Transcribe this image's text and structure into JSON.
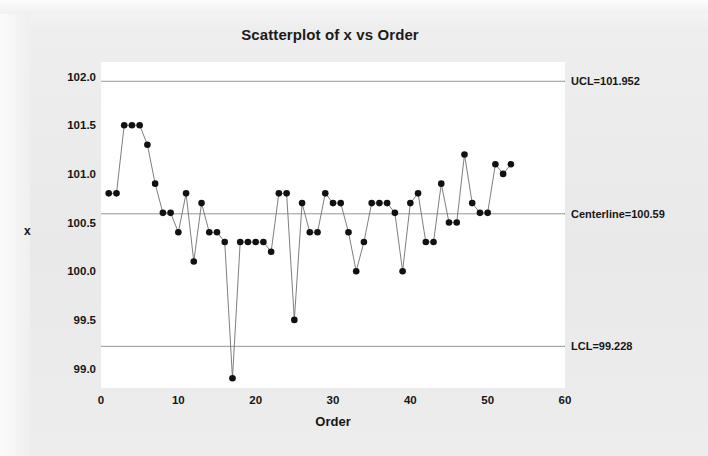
{
  "chart_data": {
    "type": "scatter",
    "title": "Scatterplot of x vs Order",
    "xlabel": "Order",
    "ylabel": "x",
    "xlim": [
      0,
      60
    ],
    "ylim": [
      98.8,
      102.15
    ],
    "xticks": [
      0,
      10,
      20,
      30,
      40,
      50,
      60
    ],
    "yticks": [
      "102.0",
      "101.5",
      "101.0",
      "100.5",
      "100.0",
      "99.5",
      "99.0"
    ],
    "ytick_values": [
      102.0,
      101.5,
      101.0,
      100.5,
      100.0,
      99.5,
      99.0
    ],
    "grid": false,
    "legend": "none",
    "marker": "filled-circle",
    "marker_color": "#111111",
    "line_color": "#6f6f6f",
    "connected": true,
    "x": [
      1,
      2,
      3,
      4,
      5,
      6,
      7,
      8,
      9,
      10,
      11,
      12,
      13,
      14,
      15,
      16,
      17,
      18,
      19,
      20,
      21,
      22,
      23,
      24,
      25,
      26,
      27,
      28,
      29,
      30,
      31,
      32,
      33,
      34,
      35,
      36,
      37,
      38,
      39,
      40,
      41,
      42,
      43,
      44,
      45,
      46,
      47,
      48,
      49,
      50,
      51,
      52,
      53
    ],
    "values": [
      100.8,
      100.8,
      101.5,
      101.5,
      101.5,
      101.3,
      100.9,
      100.6,
      100.6,
      100.4,
      100.8,
      100.1,
      100.7,
      100.4,
      100.4,
      100.3,
      98.9,
      100.3,
      100.3,
      100.3,
      100.3,
      100.2,
      100.8,
      100.8,
      99.5,
      100.7,
      100.4,
      100.4,
      100.8,
      100.7,
      100.7,
      100.4,
      100.0,
      100.3,
      100.7,
      100.7,
      100.7,
      100.6,
      100.0,
      100.7,
      100.8,
      100.3,
      100.3,
      100.9,
      100.5,
      100.5,
      101.2,
      100.7,
      100.6,
      100.6,
      101.1,
      101.0,
      101.1
    ],
    "reference_lines": [
      {
        "name": "UCL",
        "label": "UCL=101.952",
        "value": 101.952
      },
      {
        "name": "Centerline",
        "label": "Centerline=100.59",
        "value": 100.59
      },
      {
        "name": "LCL",
        "label": "LCL=99.228",
        "value": 99.228
      }
    ]
  }
}
